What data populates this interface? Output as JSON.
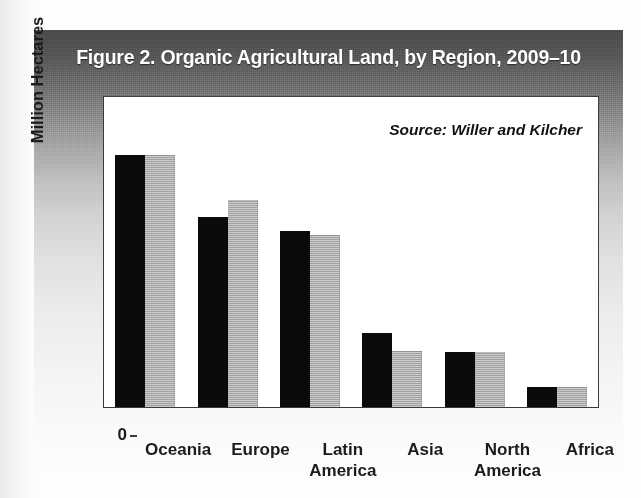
{
  "figure": {
    "title": "Figure 2. Organic Agricultural Land, by Region, 2009–10",
    "source_note": "Source: Willer and Kilcher",
    "title_band_color": "#4a4a4a",
    "panel_background_top": "#4a4a4a",
    "panel_background_bottom": "#fdfdfd",
    "plot_background": "#ffffff",
    "frame_color": "#3b3b3b"
  },
  "chart_data": {
    "type": "bar",
    "title": "Figure 2. Organic Agricultural Land, by Region, 2009–10",
    "subtitle": "",
    "annotations": [
      "Source: Willer and Kilcher"
    ],
    "xlabel": "",
    "ylabel": "Million Hectares",
    "ylim": [
      0,
      15
    ],
    "yticks": [
      0,
      3,
      6,
      9,
      12,
      15
    ],
    "ytick_labels": [
      "0",
      "3",
      "6",
      "9",
      "12",
      "15"
    ],
    "grid": false,
    "legend": false,
    "legend_position": "none",
    "categories": [
      "Oceania",
      "Europe",
      "Latin America",
      "Asia",
      "North America",
      "Africa"
    ],
    "category_lines": [
      [
        "Oceania"
      ],
      [
        "Europe"
      ],
      [
        "Latin",
        "America"
      ],
      [
        "Asia"
      ],
      [
        "North",
        "America"
      ],
      [
        "Africa"
      ]
    ],
    "series": [
      {
        "name": "2009",
        "color": "#0a0a0a",
        "values": [
          12.2,
          9.2,
          8.5,
          3.6,
          2.65,
          0.95
        ]
      },
      {
        "name": "2010",
        "color": "#b4b4b4",
        "values": [
          12.2,
          10.0,
          8.3,
          2.7,
          2.65,
          0.95
        ]
      }
    ],
    "units": "million hectares"
  },
  "axis": {
    "y_label": "Million Hectares"
  }
}
